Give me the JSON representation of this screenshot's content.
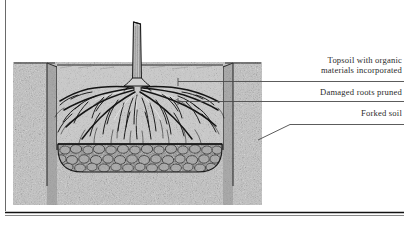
{
  "figure": {
    "alt": "Cross-section engraving of a newly planted tree in a prepared planting hole",
    "elements": {
      "trunk": "tree-trunk",
      "roots": "root-system",
      "topsoil": "topsoil-layer",
      "forked_soil": "forked-soil-layer",
      "ground_surface": "ground-surface-line",
      "hole_wall_left": "planting-hole-left-wall",
      "hole_wall_right": "planting-hole-right-wall"
    },
    "colors": {
      "soil_light": "#b9b9b9",
      "soil_mid": "#9a9a9a",
      "soil_dark": "#6e6e6e",
      "clod_fill": "#8a8a8a",
      "ink": "#1d1d1d",
      "rule": "#4a4a4a",
      "background": "#ffffff"
    }
  },
  "labels": [
    {
      "id": "topsoil",
      "text": "Topsoil with organic\nmaterials incorporated",
      "leader": "horizontal-rule-with-tick"
    },
    {
      "id": "damaged-roots",
      "text": "Damaged roots pruned",
      "leader": "horizontal-rule-with-tick"
    },
    {
      "id": "forked-soil",
      "text": "Forked soil",
      "leader": "angled-rule"
    }
  ],
  "rules": {
    "left_margin_rule": "vertical-page-rule",
    "bottom_rule": "horizontal-page-rule"
  }
}
